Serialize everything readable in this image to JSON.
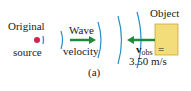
{
  "labels": {
    "source_line1": "Original",
    "source_line2": "source",
    "wave_line1": "Wave",
    "wave_line2": "velocity",
    "object": "Object",
    "vobs_symbol": "v",
    "vobs_subscript": "obs",
    "vobs_equals": "=",
    "vobs_value": "3.50 m/s",
    "caption": "(a)"
  },
  "colors": {
    "wavefront": "#2a8fc8",
    "arrow": "#1f8a3a",
    "source_dot": "#d0234e",
    "object_fill": "#f3dc7a",
    "object_stroke": "#c9a93a"
  }
}
